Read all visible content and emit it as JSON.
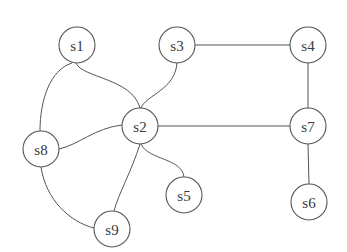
{
  "diagram": {
    "type": "undirected-graph",
    "node_radius": 18,
    "colors": {
      "background": "#ffffff",
      "stroke": "#555555",
      "label": "#3a3a3a"
    },
    "nodes": [
      {
        "id": "s1",
        "label": "s1",
        "x": 77,
        "y": 45
      },
      {
        "id": "s2",
        "label": "s2",
        "x": 140,
        "y": 126
      },
      {
        "id": "s3",
        "label": "s3",
        "x": 177,
        "y": 45
      },
      {
        "id": "s4",
        "label": "s4",
        "x": 308,
        "y": 45
      },
      {
        "id": "s5",
        "label": "s5",
        "x": 184,
        "y": 195
      },
      {
        "id": "s6",
        "label": "s6",
        "x": 309,
        "y": 202
      },
      {
        "id": "s7",
        "label": "s7",
        "x": 308,
        "y": 126
      },
      {
        "id": "s8",
        "label": "s8",
        "x": 41,
        "y": 149
      },
      {
        "id": "s9",
        "label": "s9",
        "x": 112,
        "y": 229
      }
    ],
    "edges": [
      {
        "from": "s1",
        "to": "s2",
        "path": "M76,63 C82,78 132,78 140,108"
      },
      {
        "from": "s1",
        "to": "s8",
        "path": "M72,63 C50,70 40,100 40,131"
      },
      {
        "from": "s3",
        "to": "s2",
        "path": "M177,63 C175,90 146,95 141,108"
      },
      {
        "from": "s3",
        "to": "s4",
        "path": "M195,45 L290,45"
      },
      {
        "from": "s4",
        "to": "s7",
        "path": "M308,63 L308,108"
      },
      {
        "from": "s2",
        "to": "s7",
        "path": "M158,126 L290,126"
      },
      {
        "from": "s2",
        "to": "s8",
        "path": "M122,125 C95,128 78,145 59,149"
      },
      {
        "from": "s2",
        "to": "s5",
        "path": "M141,144 C148,160 182,158 184,177"
      },
      {
        "from": "s2",
        "to": "s9",
        "path": "M140,144 C132,170 118,195 114,211"
      },
      {
        "from": "s7",
        "to": "s6",
        "path": "M308,144 L309,184"
      },
      {
        "from": "s8",
        "to": "s9",
        "path": "M41,167 C46,200 70,222 94,228"
      }
    ]
  }
}
